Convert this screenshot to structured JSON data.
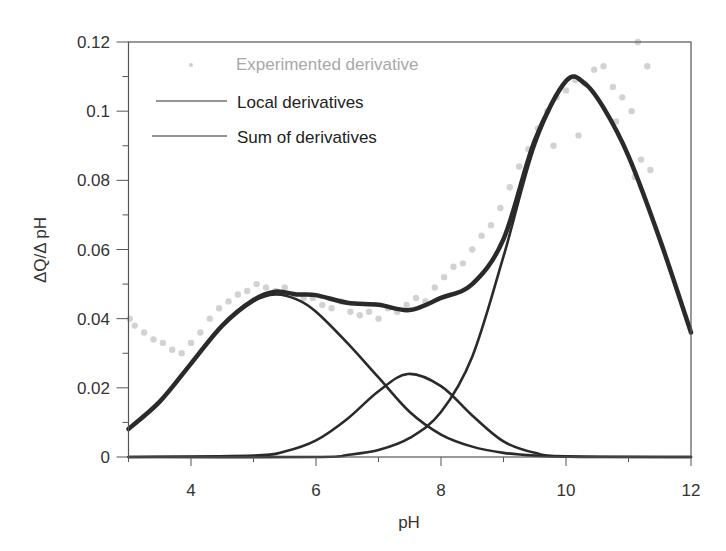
{
  "chart_data": {
    "type": "line",
    "title": "",
    "xlabel": "pH",
    "ylabel": "ΔQ/Δ pH",
    "xlim": [
      3,
      12
    ],
    "ylim": [
      0,
      0.12
    ],
    "grid": false,
    "legend_position": "upper-left inside",
    "x_ticks": [
      4,
      6,
      8,
      10,
      12
    ],
    "x_tick_labels": [
      "4",
      "6",
      "8",
      "10",
      "12"
    ],
    "y_ticks": [
      0,
      0.02,
      0.04,
      0.06,
      0.08,
      0.1,
      0.12
    ],
    "y_tick_labels": [
      "0",
      "0.02",
      "0.04",
      "0.06",
      "0.08",
      "0.1",
      "0.12"
    ],
    "legend": [
      {
        "label": "Experimented derivative",
        "style": "scatter",
        "color": "#c8c8c8"
      },
      {
        "label": "Local derivatives",
        "style": "line",
        "color": "#2a2a2a"
      },
      {
        "label": "Sum of derivatives",
        "style": "line",
        "color": "#2a2a2a"
      }
    ],
    "series": [
      {
        "name": "Local derivative 1",
        "type": "line",
        "x": [
          3.0,
          3.5,
          4.0,
          4.5,
          5.0,
          5.35,
          5.7,
          6.0,
          6.5,
          7.0,
          7.5,
          8.0,
          8.5,
          9.0,
          9.5,
          10.0,
          10.5,
          12.0
        ],
        "y": [
          0.0081,
          0.016,
          0.027,
          0.038,
          0.045,
          0.047,
          0.0455,
          0.042,
          0.033,
          0.023,
          0.013,
          0.0065,
          0.003,
          0.0012,
          0.0004,
          0.0001,
          0.0,
          0.0
        ]
      },
      {
        "name": "Local derivative 2",
        "type": "line",
        "x": [
          3.0,
          5.0,
          5.5,
          6.0,
          6.5,
          7.0,
          7.47,
          8.0,
          8.5,
          9.0,
          9.5,
          10.0,
          12.0
        ],
        "y": [
          0.0,
          0.0004,
          0.0016,
          0.0048,
          0.011,
          0.019,
          0.024,
          0.0205,
          0.012,
          0.0045,
          0.0012,
          0.0002,
          0.0
        ]
      },
      {
        "name": "Local derivative 3",
        "type": "line",
        "x": [
          3.0,
          6.0,
          6.5,
          7.0,
          7.5,
          8.0,
          8.5,
          9.0,
          9.5,
          10.0,
          10.3,
          10.6,
          11.0,
          11.5,
          12.0
        ],
        "y": [
          0.0,
          0.0,
          0.0006,
          0.002,
          0.0055,
          0.013,
          0.029,
          0.058,
          0.09,
          0.1085,
          0.108,
          0.101,
          0.087,
          0.063,
          0.036
        ]
      },
      {
        "name": "Sum of derivatives",
        "type": "line",
        "x": [
          3.0,
          3.5,
          4.0,
          4.5,
          5.0,
          5.35,
          5.7,
          6.0,
          6.5,
          7.0,
          7.5,
          8.0,
          8.5,
          9.0,
          9.5,
          10.0,
          10.3,
          10.6,
          11.0,
          11.5,
          12.0
        ],
        "y": [
          0.0081,
          0.016,
          0.027,
          0.038,
          0.0454,
          0.0478,
          0.047,
          0.0468,
          0.0446,
          0.044,
          0.0425,
          0.046,
          0.05,
          0.063,
          0.0915,
          0.1087,
          0.108,
          0.101,
          0.087,
          0.063,
          0.036
        ]
      },
      {
        "name": "Experimented derivative",
        "type": "scatter",
        "x": [
          3.02,
          3.1,
          3.25,
          3.4,
          3.55,
          3.7,
          3.85,
          4.0,
          4.15,
          4.3,
          4.45,
          4.6,
          4.75,
          4.9,
          5.05,
          5.2,
          5.35,
          5.5,
          5.65,
          5.8,
          5.95,
          6.1,
          6.25,
          6.4,
          6.55,
          6.7,
          6.85,
          7.0,
          7.15,
          7.3,
          7.45,
          7.6,
          7.75,
          7.9,
          8.05,
          8.2,
          8.35,
          8.5,
          8.65,
          8.8,
          8.95,
          9.1,
          9.25,
          9.4,
          9.55,
          9.7,
          9.85,
          10.0,
          10.15,
          10.3,
          10.45,
          10.6,
          10.75,
          10.9,
          11.05,
          11.2,
          11.35,
          11.1,
          10.8,
          10.2,
          9.8,
          11.15,
          11.3
        ],
        "y": [
          0.04,
          0.038,
          0.036,
          0.034,
          0.033,
          0.031,
          0.03,
          0.033,
          0.036,
          0.04,
          0.043,
          0.045,
          0.047,
          0.048,
          0.05,
          0.049,
          0.048,
          0.049,
          0.047,
          0.046,
          0.046,
          0.044,
          0.043,
          0.045,
          0.042,
          0.041,
          0.042,
          0.04,
          0.043,
          0.042,
          0.044,
          0.046,
          0.045,
          0.049,
          0.052,
          0.055,
          0.056,
          0.06,
          0.064,
          0.067,
          0.072,
          0.078,
          0.084,
          0.089,
          0.095,
          0.1,
          0.104,
          0.106,
          0.109,
          0.108,
          0.112,
          0.113,
          0.107,
          0.104,
          0.1,
          0.086,
          0.083,
          0.081,
          0.097,
          0.093,
          0.09,
          0.12,
          0.113
        ]
      }
    ]
  }
}
